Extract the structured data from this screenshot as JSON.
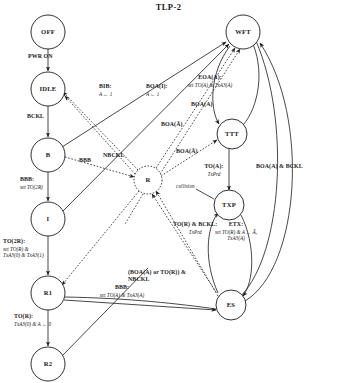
{
  "figure": {
    "title": "TLP-2",
    "type": "state-transition-diagram"
  },
  "nodes": [
    {
      "id": "OFF",
      "label": "OFF",
      "cx": 48,
      "cy": 32,
      "r": 17,
      "style": "solid"
    },
    {
      "id": "IDLE",
      "label": "IDLE",
      "cx": 48,
      "cy": 89,
      "r": 17,
      "style": "solid"
    },
    {
      "id": "B",
      "label": "B",
      "cx": 48,
      "cy": 155,
      "r": 17,
      "style": "solid"
    },
    {
      "id": "I",
      "label": "I",
      "cx": 48,
      "cy": 219,
      "r": 17,
      "style": "solid"
    },
    {
      "id": "R1",
      "label": "R1",
      "cx": 48,
      "cy": 293,
      "r": 17,
      "style": "solid"
    },
    {
      "id": "R2",
      "label": "R2",
      "cx": 48,
      "cy": 364,
      "r": 17,
      "style": "solid"
    },
    {
      "id": "R",
      "label": "R",
      "cx": 148,
      "cy": 180,
      "r": 14,
      "style": "dashed"
    },
    {
      "id": "WFT",
      "label": "WFT",
      "cx": 243,
      "cy": 32,
      "r": 17,
      "style": "solid"
    },
    {
      "id": "TTT",
      "label": "TTT",
      "cx": 232,
      "cy": 134,
      "r": 15,
      "style": "solid"
    },
    {
      "id": "TXP",
      "label": "TXP",
      "cx": 229,
      "cy": 205,
      "r": 15,
      "style": "solid"
    },
    {
      "id": "ES",
      "label": "ES",
      "cx": 231,
      "cy": 305,
      "r": 15,
      "style": "solid"
    }
  ],
  "edge_labels": [
    {
      "id": "pwr-on",
      "guard": "PWR ON",
      "action": "",
      "x": 28,
      "y": 57,
      "align": "lft"
    },
    {
      "id": "bckl-idle-b",
      "guard": "BCKL",
      "action": "",
      "x": 28,
      "y": 117,
      "align": "lft"
    },
    {
      "id": "bbb-b-i",
      "guard": "BBB:",
      "action": "set TO(2R)",
      "x": 19,
      "y": 180,
      "align": "lft"
    },
    {
      "id": "to2r-i-r1",
      "guard": "TO(2R):",
      "action": "set TO(R) &\nTxA3(0) & TxA3(1)",
      "x": 6,
      "y": 241,
      "align": "lft"
    },
    {
      "id": "tor-r1-r2",
      "guard": "TO(R):",
      "action": "TxA3(0) & A ← 0",
      "x": 18,
      "y": 316,
      "align": "lft"
    },
    {
      "id": "bbb-b-out",
      "guard": "BBB",
      "action": "",
      "x": 78,
      "y": 160,
      "align": "lft"
    },
    {
      "id": "bib-wft",
      "guard": "BIB:",
      "action": "A ← 1",
      "x": 98,
      "y": 86,
      "align": "lft"
    },
    {
      "id": "boa-i-wft",
      "guard": "BOA(I):",
      "action": "A ← 1",
      "x": 148,
      "y": 86,
      "align": "lft"
    },
    {
      "id": "nbckl-r",
      "guard": "NBCKL",
      "action": "",
      "x": 104,
      "y": 155,
      "align": "lft"
    },
    {
      "id": "boa-abar-up",
      "guard": "BOA(Ā)",
      "action": "",
      "x": 162,
      "y": 124,
      "align": "lft"
    },
    {
      "id": "boa-abar-lo",
      "guard": "BOA(Ā)",
      "action": "",
      "x": 177,
      "y": 151,
      "align": "lft"
    },
    {
      "id": "boa-a-wft",
      "guard": "BOA(A)",
      "action": "",
      "x": 193,
      "y": 104,
      "align": "lft"
    },
    {
      "id": "eoa-a-wft",
      "guard": "EOA(A):",
      "action": "set TO(A) & TxA3(A)",
      "x": 210,
      "y": 77,
      "align": "ctr"
    },
    {
      "id": "to-a-txp",
      "guard": "TO(A):",
      "action": "TxPrd",
      "x": 214,
      "y": 166,
      "align": "ctr"
    },
    {
      "id": "collision",
      "guard": "collision",
      "action": "",
      "x": 176,
      "y": 186,
      "align": "lft",
      "plain": true
    },
    {
      "id": "tor-bckl-txp",
      "guard": "TO(R) & BCKL:",
      "action": "TxPrd",
      "x": 174,
      "y": 224,
      "align": "lft"
    },
    {
      "id": "etx-es",
      "guard": "ETX:",
      "action": "set TO(R) & A ← Ā,\nTxA3(A)",
      "x": 236,
      "y": 224,
      "align": "ctr"
    },
    {
      "id": "boa-a-bckl",
      "guard": "BOA(A) & BCKL",
      "action": "",
      "x": 258,
      "y": 166,
      "align": "lft"
    },
    {
      "id": "boa-tor-nbckl",
      "guard": "(BOA(A) or TO(R)) &\nNBCKL",
      "action": "",
      "x": 130,
      "y": 265,
      "align": "lft"
    },
    {
      "id": "bbb-r1-es",
      "guard": "BBB:",
      "action": "set TO(A) & TxA3(A)",
      "x": 87,
      "y": 287,
      "align": "lft"
    }
  ],
  "edges": [
    {
      "from": "OFF",
      "to": "IDLE",
      "label": "pwr-on",
      "style": "solid"
    },
    {
      "from": "IDLE",
      "to": "B",
      "label": "bckl-idle-b",
      "style": "solid"
    },
    {
      "from": "B",
      "to": "I",
      "label": "bbb-b-i",
      "style": "solid"
    },
    {
      "from": "I",
      "to": "R1",
      "label": "to2r-i-r1",
      "style": "solid"
    },
    {
      "from": "R1",
      "to": "R2",
      "label": "tor-r1-r2",
      "style": "solid"
    },
    {
      "from": "B",
      "to": "R",
      "label": "bbb-b-out",
      "style": "dotted"
    },
    {
      "from": "B",
      "to": "WFT",
      "label": "bib-wft",
      "style": "solid"
    },
    {
      "from": "I",
      "to": "WFT",
      "label": "boa-i-wft",
      "style": "solid"
    },
    {
      "from": "R",
      "to": "IDLE",
      "label": "nbckl-r",
      "style": "dotted"
    },
    {
      "from": "R",
      "to": "WFT",
      "label": "boa-abar-up",
      "style": "dotted"
    },
    {
      "from": "R",
      "to": "TTT",
      "label": "boa-abar-lo",
      "style": "dotted"
    },
    {
      "from": "WFT",
      "to": "TTT",
      "label": "boa-a-wft",
      "style": "solid"
    },
    {
      "from": "TTT",
      "to": "WFT",
      "label": "eoa-a-wft",
      "style": "solid"
    },
    {
      "from": "TTT",
      "to": "TXP",
      "label": "to-a-txp",
      "style": "solid"
    },
    {
      "from": "TXP",
      "to": "ES",
      "label": "etx-es",
      "style": "solid"
    },
    {
      "from": "ES",
      "to": "TXP",
      "label": "tor-bckl-txp",
      "style": "solid"
    },
    {
      "from": "ES",
      "to": "WFT",
      "label": "boa-a-bckl",
      "style": "solid"
    },
    {
      "from": "ES",
      "to": "R",
      "label": "boa-tor-nbckl",
      "style": "dotted"
    },
    {
      "from": "R1",
      "to": "ES",
      "label": "bbb-r1-es",
      "style": "solid"
    }
  ]
}
